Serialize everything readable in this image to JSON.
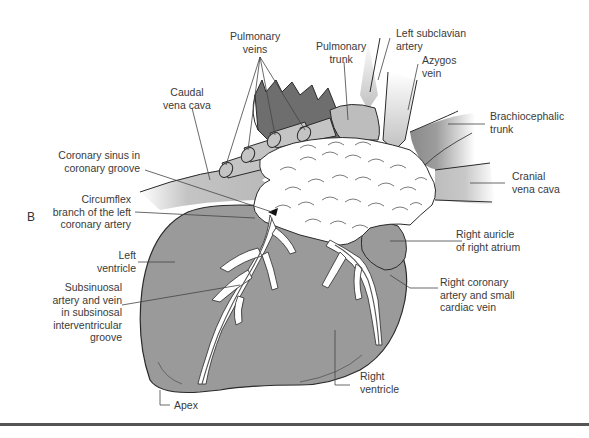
{
  "figure": {
    "panel_letter": "B",
    "colors": {
      "myocardium": "#9a9a9a",
      "vessel_dark": "#6f6f6f",
      "vessel_light": "#c8c8c8",
      "fat": "#ffffff",
      "outline": "#2a2a2a",
      "rule": "#555555"
    }
  },
  "labels": {
    "pulmonary_veins": [
      "Pulmonary",
      "veins"
    ],
    "pulmonary_trunk": [
      "Pulmonary",
      "trunk"
    ],
    "left_subclavian_artery": [
      "Left subclavian",
      "artery"
    ],
    "azygos_vein": [
      "Azygos",
      "vein"
    ],
    "caudal_vena_cava": [
      "Caudal",
      "vena cava"
    ],
    "brachiocephalic_trunk": [
      "Brachiocephalic",
      "trunk"
    ],
    "coronary_sinus": [
      "Coronary sinus in",
      "coronary groove"
    ],
    "cranial_vena_cava": [
      "Cranial",
      "vena cava"
    ],
    "circumflex_branch": [
      "Circumflex",
      "branch of the left",
      "coronary artery"
    ],
    "right_auricle": [
      "Right auricle",
      "of right atrium"
    ],
    "left_ventricle": [
      "Left",
      "ventricle"
    ],
    "right_coronary_artery": [
      "Right coronary",
      "artery and small",
      "cardiac vein"
    ],
    "subsinuosal_artery": [
      "Subsinuosal",
      "artery and vein",
      "in subsinosal",
      "interventricular",
      "groove"
    ],
    "right_ventricle": [
      "Right",
      "ventricle"
    ],
    "apex": [
      "Apex"
    ]
  }
}
